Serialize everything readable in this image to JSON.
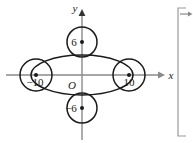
{
  "figure": {
    "kind": "coordinate-plane-geometry-diagram",
    "background_color": "#ffffff",
    "stroke_color": "#1a1a1a",
    "axis_color": "#8a8a8a",
    "width": 193,
    "height": 143
  },
  "axes": {
    "x_label": "x",
    "y_label": "y",
    "origin_label": "O",
    "x_axis_y_px": 75,
    "y_axis_x_px": 82,
    "x_axis_from_px": 6,
    "x_axis_to_px": 160,
    "y_axis_from_px": 10,
    "y_axis_to_px": 140
  },
  "ellipse": {
    "name": "central-ellipse",
    "center_x_px": 82,
    "center_y_px": 75,
    "rx_px": 51,
    "ry_px": 20
  },
  "circles": [
    {
      "name": "circle-left",
      "label": "−10",
      "center_x_px": 36,
      "center_y_px": 75,
      "radius_px": 16,
      "label_dx_px": -1,
      "label_dy_px": 11,
      "dot": true
    },
    {
      "name": "circle-right",
      "label": "10",
      "center_x_px": 129,
      "center_y_px": 75,
      "radius_px": 16,
      "label_dx_px": 0,
      "label_dy_px": 11,
      "dot": true
    },
    {
      "name": "circle-top",
      "label": "6",
      "center_x_px": 82,
      "center_y_px": 42,
      "radius_px": 15,
      "label_dx_px": -8,
      "label_dy_px": 4,
      "dot": true
    },
    {
      "name": "circle-bottom",
      "label": "−6",
      "center_x_px": 82,
      "center_y_px": 108,
      "radius_px": 15,
      "label_dx_px": -11,
      "label_dy_px": 4,
      "dot": true
    }
  ],
  "bracket": {
    "name": "right-edge-bracket",
    "x_px": 178,
    "top_px": 8,
    "bottom_px": 136,
    "tick_len_px": 8,
    "arrow_y_px": 14,
    "arrow_to_x_px": 192
  }
}
